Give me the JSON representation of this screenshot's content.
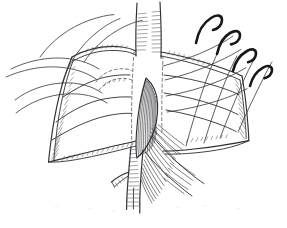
{
  "figure": {
    "caption": "",
    "medium": "pen-and-ink line drawing",
    "canvas": {
      "width": 287,
      "height": 228
    },
    "colors": {
      "background": "#ffffff",
      "ink": "#2e2e33",
      "ink_light": "#55555c",
      "hatch": "#5a5a62",
      "needle": "#171719",
      "dashed_guide": "#5d5d66"
    },
    "parts": [
      {
        "id": "left-flap",
        "name": "left tissue flap",
        "description": "Large draped tissue flap on the left with a hatched cut edge and a pointed inferior corner."
      },
      {
        "id": "right-flap",
        "name": "right tissue flap",
        "description": "Draped tissue flap on the right with hatched cut edge and pointed lateral corner."
      },
      {
        "id": "vertical-vessel",
        "name": "vertical vessel trunk",
        "description": "Tubular vessel running vertically through the top center of the field, shown with transverse hatch shading."
      },
      {
        "id": "central-anastomosis",
        "name": "central anastomosis",
        "description": "Dark densely-hatched leaf-shaped structure in the center, the sutured junction."
      },
      {
        "id": "distal-branches",
        "name": "distal vessel branches",
        "description": "Branching vessel limbs descending below the anastomosis toward the lower center."
      },
      {
        "id": "fan-hatching",
        "name": "fanned shading",
        "description": "Fan of fine parallel strokes spreading to the lower right from the anastomosis."
      },
      {
        "id": "incision-guides",
        "name": "dashed incision guides",
        "description": "Dashed guide lines marking the planned incision and hidden contour."
      }
    ],
    "needles": [
      {
        "id": "needle-1",
        "label": "curved suture needle",
        "position": "upper right, innermost"
      },
      {
        "id": "needle-2",
        "label": "curved suture needle",
        "position": "upper right, second"
      },
      {
        "id": "needle-3",
        "label": "curved suture needle",
        "position": "right, third"
      },
      {
        "id": "needle-4",
        "label": "curved suture needle",
        "position": "far right, outermost"
      }
    ],
    "suture_count": 8,
    "annotations": []
  }
}
